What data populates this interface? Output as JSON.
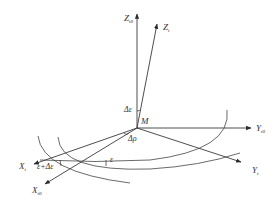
{
  "diagram": {
    "type": "coordinate-frame-rotation",
    "origin": {
      "label": "M"
    },
    "axes": [
      {
        "id": "z_t0",
        "main": "Z",
        "sub": "t0"
      },
      {
        "id": "z_t",
        "main": "Z",
        "sub": "t"
      },
      {
        "id": "y_t0",
        "main": "Y",
        "sub": "t0"
      },
      {
        "id": "y_t",
        "main": "Y",
        "sub": "t"
      },
      {
        "id": "x_t",
        "main": "X",
        "sub": "t"
      },
      {
        "id": "x_t0",
        "main": "X",
        "sub": "t0"
      }
    ],
    "angles": {
      "delta_epsilon": "Δε",
      "delta_rho": "Δρ",
      "epsilon": "ε",
      "epsilon_plus_delta": "ε+Δε"
    },
    "colors": {
      "stroke": "#3a3a3a",
      "text": "#333333",
      "background": "#ffffff"
    }
  }
}
